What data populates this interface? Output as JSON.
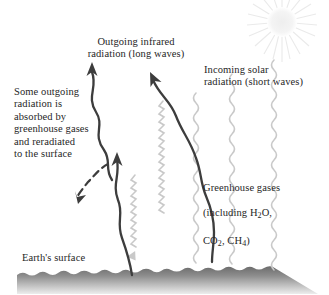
{
  "figure": {
    "type": "greenhouse-effect-diagram",
    "background_color": "#ffffff",
    "text_color": "#262626"
  },
  "labels": {
    "outgoing_ir": "Outgoing infrared\nradiation (long waves)",
    "absorbed": "Some outgoing\nradiation is\nabsorbed by\ngreenhouse gases\nand reradiated\nto the surface",
    "incoming_solar": "Incoming solar\nradiation (short waves)",
    "greenhouse_gases_line1": "Greenhouse gases",
    "greenhouse_gases_line2_pre": "(including H",
    "greenhouse_gases_line2_sub": "2",
    "greenhouse_gases_line2_post": "O,",
    "greenhouse_gases_line3_a": "CO",
    "greenhouse_gases_line3_a_sub": "2",
    "greenhouse_gases_line3_b": ", CH",
    "greenhouse_gases_line3_b_sub": "4",
    "greenhouse_gases_line3_end": ")",
    "earth_surface": "Earth's surface"
  },
  "elements": {
    "sun": "sun-burst",
    "ground": "earth-surface-band",
    "outgoing_waves": "dark-wavy-upward-arrows",
    "solar_waves": "light-gray-wavy-downward-lines",
    "reradiated_arrow": "dashed-downward-arrow"
  },
  "colors": {
    "ir_wave": "#3d3d3d",
    "solar_wave": "#c8c8c8",
    "ground_top": "#6e6e6e",
    "ground_bottom": "#e8e8e8",
    "sun": "#f2f2f2"
  }
}
